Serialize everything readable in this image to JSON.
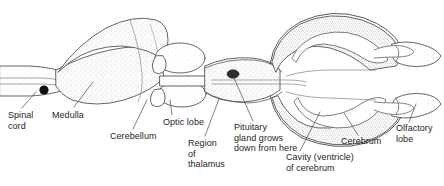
{
  "figure": {
    "kind": "anatomical-diagram",
    "background_color": "#ffffff",
    "ink_color": "#3c3c3c",
    "stipple_color": "#8a8a8a",
    "text_color": "#262626",
    "accent_dark": "#141414",
    "width": 444,
    "height": 186
  },
  "labels": [
    {
      "id": "spinal-cord",
      "text": "Spinal\ncord",
      "x": 8,
      "y": 112
    },
    {
      "id": "medulla",
      "text": "Medulla",
      "x": 52,
      "y": 112
    },
    {
      "id": "cerebellum",
      "text": "Cerebellum",
      "x": 110,
      "y": 133
    },
    {
      "id": "optic-lobe",
      "text": "Optic lobe",
      "x": 163,
      "y": 119
    },
    {
      "id": "region-of-thalamus",
      "text": "Region\nof\nthalamus",
      "x": 188,
      "y": 140
    },
    {
      "id": "pituitary-gland",
      "text": "Pituitary\ngland grows\ndown from here",
      "x": 234,
      "y": 125
    },
    {
      "id": "cavity-ventricle",
      "text": "Cavity (ventricle)\nof cerebrum",
      "x": 286,
      "y": 155
    },
    {
      "id": "cerebrum",
      "text": "Cerebrum",
      "x": 341,
      "y": 139
    },
    {
      "id": "olfactory-lobe",
      "text": "Olfactory\nlobe",
      "x": 396,
      "y": 126
    }
  ],
  "structures": [
    {
      "id": "spinal-cord-tube",
      "name": "spinal cord"
    },
    {
      "id": "medulla-body",
      "name": "medulla oblongata"
    },
    {
      "id": "cerebellum-dome",
      "name": "cerebellum"
    },
    {
      "id": "optic-lobe-upper",
      "name": "optic lobe (upper)"
    },
    {
      "id": "optic-lobe-lower",
      "name": "optic lobe (lower)"
    },
    {
      "id": "thalamus-region",
      "name": "region of thalamus"
    },
    {
      "id": "pituitary-spot",
      "name": "pituitary gland origin"
    },
    {
      "id": "cerebrum-upper",
      "name": "cerebral hemisphere (upper)"
    },
    {
      "id": "cerebrum-lower",
      "name": "cerebral hemisphere (lower)"
    },
    {
      "id": "ventricle-upper",
      "name": "cerebral ventricle (upper)"
    },
    {
      "id": "ventricle-lower",
      "name": "cerebral ventricle (lower)"
    },
    {
      "id": "olfactory-lobe-upper",
      "name": "olfactory lobe (upper)"
    },
    {
      "id": "olfactory-lobe-lower",
      "name": "olfactory lobe (lower)"
    }
  ],
  "leader_lines": [
    {
      "id": "leader-spinal-cord",
      "from": [
        22,
        108
      ],
      "to": [
        35,
        92
      ]
    },
    {
      "id": "leader-medulla",
      "from": [
        72,
        107
      ],
      "to": [
        92,
        82
      ]
    },
    {
      "id": "leader-cerebellum",
      "from": [
        133,
        129
      ],
      "to": [
        146,
        100
      ]
    },
    {
      "id": "leader-optic-lobe",
      "from": [
        172,
        115
      ],
      "to": [
        170,
        97
      ]
    },
    {
      "id": "leader-thalamus",
      "from": [
        205,
        136
      ],
      "to": [
        216,
        98
      ]
    },
    {
      "id": "leader-pituitary",
      "from": [
        253,
        121
      ],
      "to": [
        233,
        76
      ]
    },
    {
      "id": "leader-cavity",
      "from": [
        300,
        151
      ],
      "to": [
        318,
        110
      ]
    },
    {
      "id": "leader-cerebrum",
      "from": [
        358,
        135
      ],
      "to": [
        346,
        112
      ]
    },
    {
      "id": "leader-olfactory",
      "from": [
        408,
        122
      ],
      "to": [
        415,
        104
      ]
    }
  ]
}
